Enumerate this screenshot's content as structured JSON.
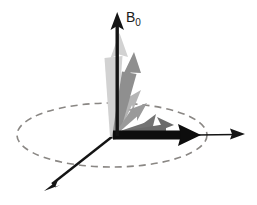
{
  "figure": {
    "kind": "vector-diagram",
    "width": 257,
    "height": 205,
    "background": "#ffffff",
    "labels": {
      "b0_main": "B",
      "b0_subscript": "0",
      "b0_full": "B0"
    }
  },
  "chart_data": {
    "type": "scatter",
    "title": "",
    "xlabel": "",
    "ylabel": "",
    "grid": false,
    "legend_position": "none",
    "origin": {
      "x": 113,
      "y": 136
    },
    "axes": [
      {
        "name": "b0-axis",
        "label": "B0",
        "color": "#141414",
        "from": {
          "x": 113,
          "y": 136
        },
        "to": {
          "x": 120,
          "y": 14
        },
        "arrow": "solid",
        "width": 3
      },
      {
        "name": "x-axis-right",
        "label": "",
        "color": "#141414",
        "from": {
          "x": 113,
          "y": 136
        },
        "to": {
          "x": 245,
          "y": 134
        },
        "arrow": "solid",
        "width": 1.6
      },
      {
        "name": "y-axis-front-left",
        "label": "",
        "color": "#141414",
        "from": {
          "x": 113,
          "y": 136
        },
        "to": {
          "x": 44,
          "y": 191
        },
        "arrow": "solid",
        "width": 2.2
      }
    ],
    "transverse_plane": {
      "name": "dashed-ellipse",
      "center": {
        "x": 112,
        "y": 135
      },
      "rx": 95,
      "ry": 32,
      "stroke": "#8a8784",
      "stroke_width": 1.6,
      "dash": "7 5",
      "fill": "none"
    },
    "vectors": [
      {
        "index": 0,
        "label": "M0-vertical",
        "color": "#d2d2d2",
        "angle_from_vertical_deg": 3,
        "length": 104,
        "tip": {
          "x": 119,
          "y": 33
        },
        "shaft_width": 7,
        "head_width": 17,
        "head_length": 20
      },
      {
        "index": 1,
        "label": "M1",
        "color": "#8f8f8f",
        "angle_from_vertical_deg": 14,
        "length": 88,
        "tip": {
          "x": 134,
          "y": 52
        },
        "shaft_width": 7,
        "head_width": 17,
        "head_length": 20
      },
      {
        "index": 2,
        "label": "M2",
        "color": "#b5b5b5",
        "angle_from_vertical_deg": 32,
        "length": 58,
        "tip": {
          "x": 141,
          "y": 90
        },
        "shaft_width": 7,
        "head_width": 16,
        "head_length": 18
      },
      {
        "index": 3,
        "label": "M3",
        "color": "#9a9a9a",
        "angle_from_vertical_deg": 46,
        "length": 48,
        "tip": {
          "x": 147,
          "y": 103
        },
        "shaft_width": 7,
        "head_width": 16,
        "head_length": 18
      },
      {
        "index": 4,
        "label": "M4",
        "color": "#737373",
        "angle_from_vertical_deg": 62,
        "length": 49,
        "tip": {
          "x": 156,
          "y": 114
        },
        "shaft_width": 8,
        "head_width": 17,
        "head_length": 19
      },
      {
        "index": 5,
        "label": "M5",
        "color": "#6b6b6b",
        "angle_from_vertical_deg": 76,
        "length": 62,
        "tip": {
          "x": 174,
          "y": 125
        },
        "shaft_width": 8,
        "head_width": 18,
        "head_length": 20
      },
      {
        "index": 6,
        "label": "Mxy-horizontal",
        "color": "#0d0d0d",
        "angle_from_vertical_deg": 90,
        "length": 88,
        "tip": {
          "x": 201,
          "y": 135
        },
        "shaft_width": 9,
        "head_width": 21,
        "head_length": 22
      }
    ],
    "colors": {
      "axis": "#141414",
      "ellipse": "#8a8784",
      "vector_lightest": "#d2d2d2",
      "vector_darkest": "#0d0d0d",
      "background": "#ffffff"
    },
    "annotations": [
      {
        "text": "B0",
        "x": 127,
        "y": 12
      }
    ]
  }
}
